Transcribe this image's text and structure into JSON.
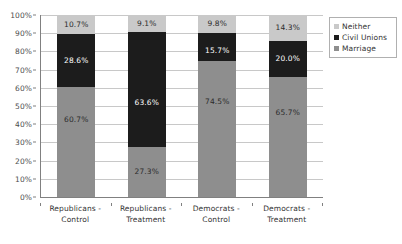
{
  "chart_data": {
    "type": "bar",
    "subtype": "stacked-100-percent",
    "title": "",
    "xlabel": "",
    "ylabel": "",
    "ylim": [
      0,
      100
    ],
    "y_tick_labels": [
      "100%",
      "90%",
      "80%",
      "70%",
      "60%",
      "50%",
      "40%",
      "30%",
      "20%",
      "10%",
      "0%"
    ],
    "y_tick_values": [
      100,
      90,
      80,
      70,
      60,
      50,
      40,
      30,
      20,
      10,
      0
    ],
    "grid": true,
    "grid_axis": "y",
    "legend_position": "right",
    "categories": [
      "Republicans - Control",
      "Republicans - Treatment",
      "Democrats - Control",
      "Democrats - Treatment"
    ],
    "category_lines": [
      [
        "Republicans -",
        "Control"
      ],
      [
        "Republicans -",
        "Treatment"
      ],
      [
        "Democrats -",
        "Control"
      ],
      [
        "Democrats -",
        "Treatment"
      ]
    ],
    "series": [
      {
        "name": "Marriage",
        "color": "#8e8e8e",
        "values": [
          60.7,
          27.3,
          74.5,
          65.7
        ],
        "labels": [
          "60.7%",
          "27.3%",
          "74.5%",
          "65.7%"
        ]
      },
      {
        "name": "Civil Unions",
        "color": "#1c1c1c",
        "values": [
          28.6,
          63.6,
          15.7,
          20.0
        ],
        "labels": [
          "28.6%",
          "63.6%",
          "15.7%",
          "20.0%"
        ]
      },
      {
        "name": "Neither",
        "color": "#c9c9c9",
        "values": [
          10.7,
          9.1,
          9.8,
          14.3
        ],
        "labels": [
          "10.7%",
          "9.1%",
          "9.8%",
          "14.3%"
        ]
      }
    ],
    "stack_order_top_to_bottom": [
      "Neither",
      "Civil Unions",
      "Marriage"
    ]
  },
  "legend": {
    "items": [
      {
        "label": "Neither",
        "color": "#c9c9c9"
      },
      {
        "label": "Civil Unions",
        "color": "#1c1c1c"
      },
      {
        "label": "Marriage",
        "color": "#8e8e8e"
      }
    ]
  },
  "colors": {
    "neither": "#c9c9c9",
    "civil_unions": "#1c1c1c",
    "marriage": "#8e8e8e",
    "gridline": "#c8c8c8",
    "axis": "#808080",
    "background": "#ffffff"
  }
}
